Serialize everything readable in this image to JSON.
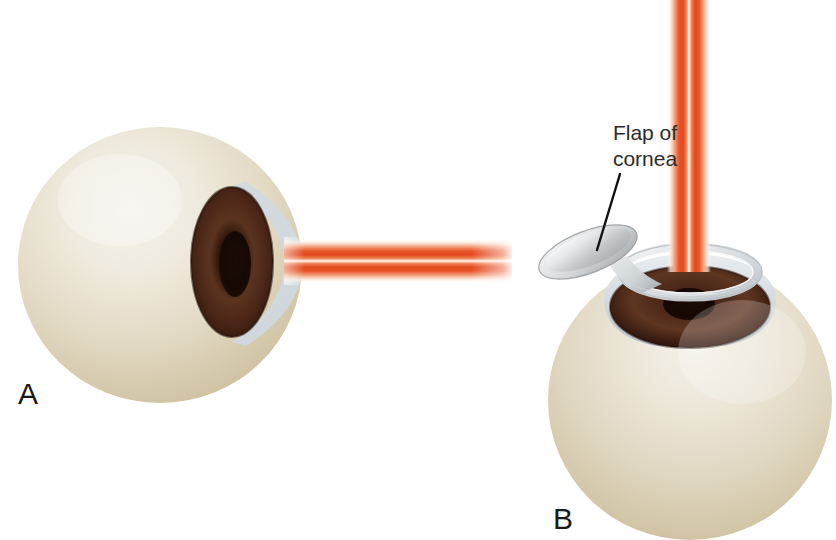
{
  "figure": {
    "background_color": "#ffffff",
    "width": 836,
    "height": 540
  },
  "panels": [
    {
      "id": "A",
      "letter": "A",
      "letter_x": 18,
      "letter_y": 404,
      "description": "Side view of eyeball with laser beam striking the intact cornea"
    },
    {
      "id": "B",
      "letter": "B",
      "letter_x": 553,
      "letter_y": 529,
      "description": "Angled view of eyeball with the corneal flap folded back and laser beam entering from above"
    }
  ],
  "annotations": [
    {
      "name": "flap-of-cornea",
      "line1": "Flap of",
      "line2": "cornea",
      "text_x": 645,
      "text_line1_y": 140,
      "text_line2_y": 166,
      "leader_x1": 620,
      "leader_y1": 174,
      "leader_x2": 597,
      "leader_y2": 250
    }
  ],
  "beams": [
    {
      "name": "laser-beam-horizontal",
      "panel": "A",
      "orientation": "horizontal",
      "x_start": 284,
      "x_end": 512,
      "center_y": 261,
      "thickness": 44
    },
    {
      "name": "laser-beam-vertical",
      "panel": "B",
      "orientation": "vertical",
      "y_start": 0,
      "y_end": 272,
      "center_x": 689,
      "thickness": 44
    }
  ],
  "colors": {
    "background": "#ffffff",
    "sclera_highlight": "#f3efe6",
    "sclera_mid": "#e4dcc8",
    "sclera_shadow": "#cabf9f",
    "sclera_edge": "#bfb396",
    "cornea_light": "#e4ecf1",
    "cornea_mid": "#c6d3dc",
    "cornea_shadow": "#aebcc7",
    "cornea_rim": "#d9dee1",
    "flap_top": "#f0f1f2",
    "flap_body": "#b9bcbf",
    "flap_edge": "#8e9295",
    "iris_outer": "#3b1c0f",
    "iris_mid": "#5b3420",
    "iris_inner": "#2a1208",
    "pupil": "#160803",
    "beam_core": "#ffffff",
    "beam_band": "#e8562a",
    "beam_band_soft": "#ef7f50",
    "beam_glow": "#fbd9c8",
    "label_text": "#2b2b2b",
    "letter_text": "#1a1a1a",
    "leader_line": "#111111"
  }
}
